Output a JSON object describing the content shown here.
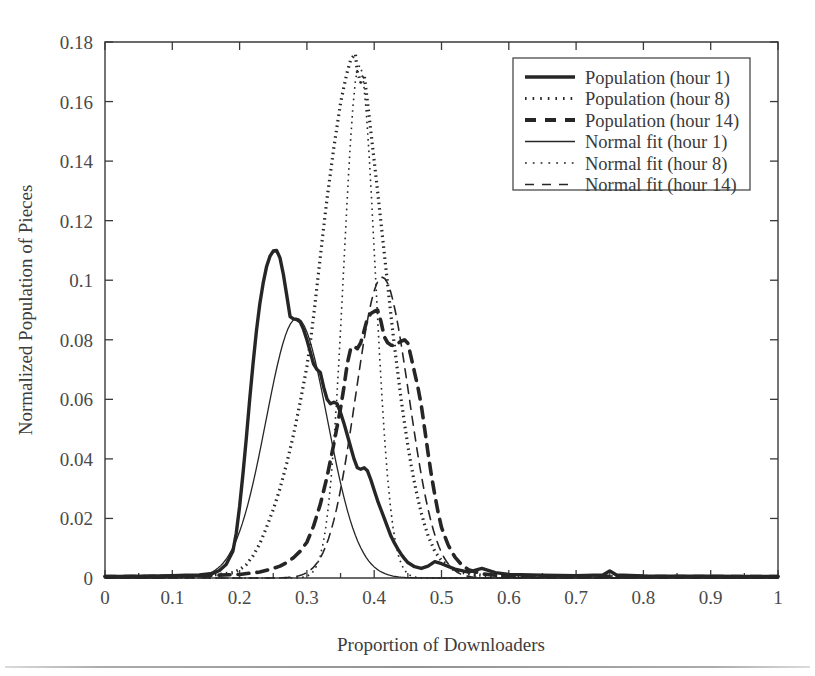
{
  "chart_data": {
    "type": "line",
    "title": "",
    "xlabel": "Proportion of Downloaders",
    "ylabel": "Normalized Population of Pieces",
    "xlim": [
      0,
      1
    ],
    "ylim": [
      0,
      0.18
    ],
    "grid": false,
    "legend_position": "top-right",
    "xticks": [
      "0",
      "0.1",
      "0.2",
      "0.3",
      "0.4",
      "0.5",
      "0.6",
      "0.7",
      "0.8",
      "0.9",
      "1"
    ],
    "xtick_values": [
      0,
      0.1,
      0.2,
      0.3,
      0.4,
      0.5,
      0.6,
      0.7,
      0.8,
      0.9,
      1
    ],
    "yticks": [
      "0",
      "0.02",
      "0.04",
      "0.06",
      "0.08",
      "0.1",
      "0.12",
      "0.14",
      "0.16",
      "0.18"
    ],
    "ytick_values": [
      0,
      0.02,
      0.04,
      0.06,
      0.08,
      0.1,
      0.12,
      0.14,
      0.16,
      0.18
    ],
    "legend": [
      "Population (hour 1)",
      "Population (hour 8)",
      "Population (hour 14)",
      "Normal fit (hour 1)",
      "Normal fit (hour 8)",
      "Normal fit (hour 14)"
    ],
    "series": [
      {
        "name": "Population (hour 1)",
        "style": "solid-thick",
        "stroke_width": 3.4,
        "dash": "none",
        "peak_x": 0.255,
        "peak_y": 0.11,
        "x": [
          0.0,
          0.02,
          0.04,
          0.06,
          0.08,
          0.1,
          0.12,
          0.14,
          0.16,
          0.17,
          0.18,
          0.19,
          0.195,
          0.2,
          0.205,
          0.21,
          0.215,
          0.22,
          0.225,
          0.23,
          0.235,
          0.24,
          0.245,
          0.25,
          0.255,
          0.26,
          0.265,
          0.27,
          0.275,
          0.28,
          0.285,
          0.29,
          0.295,
          0.3,
          0.305,
          0.31,
          0.315,
          0.32,
          0.325,
          0.33,
          0.335,
          0.34,
          0.345,
          0.35,
          0.355,
          0.36,
          0.365,
          0.37,
          0.375,
          0.38,
          0.385,
          0.39,
          0.395,
          0.4,
          0.405,
          0.41,
          0.415,
          0.42,
          0.425,
          0.43,
          0.435,
          0.44,
          0.445,
          0.45,
          0.46,
          0.47,
          0.48,
          0.49,
          0.5,
          0.52,
          0.54,
          0.56,
          0.58,
          0.6,
          0.65,
          0.7,
          0.74,
          0.75,
          0.76,
          0.8,
          0.85,
          0.9,
          0.95,
          1.0
        ],
        "y": [
          0.0005,
          0.0005,
          0.0006,
          0.0006,
          0.0007,
          0.0008,
          0.0009,
          0.001,
          0.0015,
          0.0025,
          0.0045,
          0.009,
          0.015,
          0.024,
          0.035,
          0.047,
          0.06,
          0.072,
          0.083,
          0.092,
          0.099,
          0.1045,
          0.108,
          0.1098,
          0.11,
          0.1075,
          0.102,
          0.095,
          0.0878,
          0.087,
          0.0868,
          0.086,
          0.0835,
          0.08,
          0.076,
          0.0718,
          0.07,
          0.069,
          0.064,
          0.06,
          0.0585,
          0.059,
          0.0585,
          0.0555,
          0.052,
          0.048,
          0.044,
          0.04,
          0.037,
          0.0365,
          0.037,
          0.036,
          0.033,
          0.0295,
          0.026,
          0.023,
          0.02,
          0.017,
          0.014,
          0.0118,
          0.0098,
          0.008,
          0.0065,
          0.0052,
          0.0038,
          0.0032,
          0.004,
          0.0055,
          0.0048,
          0.003,
          0.002,
          0.0032,
          0.0018,
          0.0012,
          0.0009,
          0.0008,
          0.001,
          0.0024,
          0.001,
          0.0007,
          0.0006,
          0.0006,
          0.0005,
          0.0005
        ]
      },
      {
        "name": "Population (hour 8)",
        "style": "dotted-thick",
        "stroke_width": 3.2,
        "dash": "1.5 4",
        "peak_x": 0.372,
        "peak_y": 0.176,
        "x": [
          0.0,
          0.05,
          0.1,
          0.14,
          0.17,
          0.19,
          0.2,
          0.21,
          0.22,
          0.23,
          0.24,
          0.25,
          0.26,
          0.27,
          0.28,
          0.29,
          0.3,
          0.305,
          0.31,
          0.315,
          0.32,
          0.325,
          0.33,
          0.335,
          0.34,
          0.345,
          0.35,
          0.355,
          0.36,
          0.365,
          0.37,
          0.372,
          0.375,
          0.38,
          0.385,
          0.39,
          0.395,
          0.4,
          0.405,
          0.41,
          0.415,
          0.42,
          0.425,
          0.43,
          0.435,
          0.44,
          0.445,
          0.45,
          0.455,
          0.46,
          0.465,
          0.47,
          0.475,
          0.48,
          0.49,
          0.5,
          0.52,
          0.54,
          0.56,
          0.6,
          0.7,
          0.8,
          0.9,
          1.0
        ],
        "y": [
          0.0005,
          0.0005,
          0.0006,
          0.0008,
          0.0012,
          0.0018,
          0.0028,
          0.0045,
          0.0075,
          0.0115,
          0.017,
          0.023,
          0.03,
          0.0385,
          0.048,
          0.059,
          0.071,
          0.079,
          0.088,
          0.098,
          0.108,
          0.118,
          0.1275,
          0.136,
          0.1445,
          0.152,
          0.1595,
          0.165,
          0.17,
          0.174,
          0.1755,
          0.176,
          0.17,
          0.1665,
          0.169,
          0.16,
          0.15,
          0.14,
          0.13,
          0.1195,
          0.109,
          0.0985,
          0.088,
          0.078,
          0.069,
          0.06,
          0.052,
          0.0445,
          0.0378,
          0.0318,
          0.0265,
          0.0218,
          0.0178,
          0.0142,
          0.009,
          0.0058,
          0.0025,
          0.0014,
          0.0009,
          0.0007,
          0.0006,
          0.0005,
          0.0005,
          0.0005
        ]
      },
      {
        "name": "Population (hour 14)",
        "style": "dashed-thick",
        "stroke_width": 3.6,
        "dash": "11 8",
        "peak_x": 0.405,
        "peak_y": 0.09,
        "x": [
          0.0,
          0.05,
          0.1,
          0.15,
          0.2,
          0.23,
          0.25,
          0.26,
          0.27,
          0.28,
          0.29,
          0.3,
          0.31,
          0.32,
          0.33,
          0.34,
          0.35,
          0.355,
          0.36,
          0.365,
          0.37,
          0.375,
          0.38,
          0.385,
          0.39,
          0.395,
          0.4,
          0.405,
          0.41,
          0.415,
          0.42,
          0.425,
          0.43,
          0.435,
          0.44,
          0.445,
          0.45,
          0.455,
          0.46,
          0.465,
          0.47,
          0.475,
          0.48,
          0.485,
          0.49,
          0.495,
          0.5,
          0.51,
          0.52,
          0.53,
          0.54,
          0.56,
          0.58,
          0.6,
          0.7,
          0.8,
          0.9,
          1.0
        ],
        "y": [
          0.0005,
          0.0005,
          0.0006,
          0.0008,
          0.0012,
          0.002,
          0.0032,
          0.004,
          0.0052,
          0.0068,
          0.009,
          0.012,
          0.0175,
          0.0248,
          0.034,
          0.045,
          0.057,
          0.064,
          0.072,
          0.077,
          0.0778,
          0.077,
          0.079,
          0.083,
          0.0872,
          0.0888,
          0.0895,
          0.09,
          0.0862,
          0.081,
          0.079,
          0.0782,
          0.078,
          0.0788,
          0.0795,
          0.08,
          0.0788,
          0.074,
          0.069,
          0.064,
          0.058,
          0.05,
          0.042,
          0.0345,
          0.028,
          0.022,
          0.017,
          0.011,
          0.007,
          0.0044,
          0.0028,
          0.0014,
          0.0009,
          0.0007,
          0.0006,
          0.0005,
          0.0005,
          0.0005
        ]
      },
      {
        "name": "Normal fit (hour 1)",
        "style": "solid-thin",
        "stroke_width": 1.3,
        "dash": "none",
        "mu": 0.285,
        "sigma": 0.0458,
        "peak_y": 0.0872
      },
      {
        "name": "Normal fit (hour 8)",
        "style": "dotted-thin",
        "stroke_width": 1.6,
        "dash": "1.6 4.2",
        "mu": 0.378,
        "sigma": 0.0232,
        "peak_y": 0.1725
      },
      {
        "name": "Normal fit (hour 14)",
        "style": "dashed-thin",
        "stroke_width": 1.6,
        "dash": "9 7",
        "mu": 0.412,
        "sigma": 0.0396,
        "peak_y": 0.101
      }
    ]
  },
  "legend_samples": [
    {
      "label": "Population (hour 1)",
      "style": "solid-thick",
      "width": 3.4,
      "dash": "none"
    },
    {
      "label": "Population (hour 8)",
      "style": "dotted-thick",
      "width": 3.0,
      "dash": "1.6 6"
    },
    {
      "label": "Population (hour 14)",
      "style": "dashed-thick",
      "width": 4.0,
      "dash": "11 9"
    },
    {
      "label": "Normal fit (hour 1)",
      "style": "solid-thin",
      "width": 1.3,
      "dash": "none"
    },
    {
      "label": "Normal fit (hour 8)",
      "style": "dotted-thin",
      "width": 1.5,
      "dash": "1.8 6"
    },
    {
      "label": "Normal fit (hour 14)",
      "style": "dashed-thin",
      "width": 1.4,
      "dash": "9 8"
    }
  ],
  "colors": {
    "stroke": "#262626",
    "axis": "#3a3a3a",
    "text": "#3c3c3c",
    "background": "#ffffff"
  }
}
